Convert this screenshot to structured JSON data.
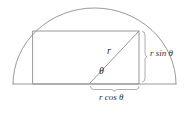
{
  "figure": {
    "stroke_color": "#8d8d8d",
    "label_color": "#2f2f2f",
    "background": "#ffffff"
  },
  "labels": {
    "radius": "r",
    "angle": "θ",
    "height": "r sin θ",
    "half_width": "r cos θ"
  },
  "geometry": {
    "circle_center_x": 94.5,
    "circle_center_y": 84,
    "circle_radius": 82,
    "arc_left_x": 13,
    "arc_right_x": 176,
    "baseline_y": 84,
    "rect_left_x": 33,
    "rect_right_x": 139,
    "rect_top_y": 31,
    "rect_bottom_y": 84,
    "radius_line_from_x": 90,
    "radius_line_from_y": 83,
    "radius_line_to_x": 139,
    "radius_line_to_y": 31,
    "vertical_brace_x": 144,
    "horizontal_brace_y": 89
  }
}
